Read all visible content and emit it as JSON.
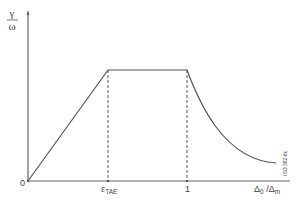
{
  "diagram": {
    "y_axis": {
      "numerator": "γ",
      "denominator": "ω"
    },
    "x_axis": {
      "label_main": "Δ",
      "label_sub0": "0",
      "label_slash": " /Δ",
      "label_subm": "m"
    },
    "ticks": {
      "origin": "0",
      "eps_main": "ε",
      "eps_sub": "TAE",
      "one": "1"
    },
    "watermark": "ISO 382-6c",
    "colors": {
      "line": "#555555",
      "axis": "#666666",
      "dashed": "#555555"
    },
    "segments": [
      {
        "type": "linear-rise",
        "from": [
          0,
          0
        ],
        "to": [
          "ε_TAE",
          "plateau"
        ]
      },
      {
        "type": "plateau",
        "from": [
          "ε_TAE",
          "plateau"
        ],
        "to": [
          1,
          "plateau"
        ]
      },
      {
        "type": "decay-curve",
        "from": [
          1,
          "plateau"
        ],
        "to": [
          "end",
          "low"
        ]
      }
    ]
  }
}
